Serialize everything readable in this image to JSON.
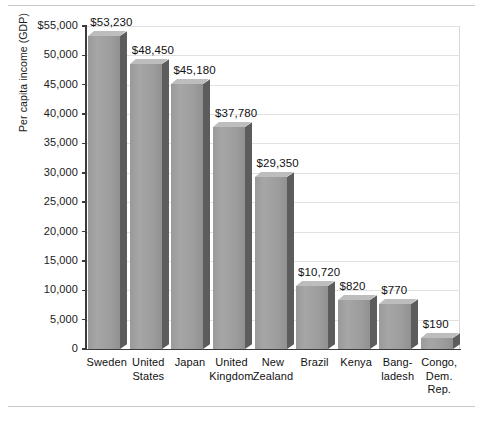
{
  "figure": {
    "has_top_rule": true,
    "has_bottom_rule": true
  },
  "chart_data": {
    "type": "bar",
    "title": "",
    "subtitle": "",
    "xlabel": "",
    "ylabel": "Per capita income (GDP)",
    "categories": [
      "Sweden",
      "United States",
      "Japan",
      "United Kingdom",
      "New Zealand",
      "Brazil",
      "Kenya",
      "Bangladesh",
      "Congo, Dem. Rep."
    ],
    "category_lines": [
      [
        "Sweden"
      ],
      [
        "United",
        "States"
      ],
      [
        "Japan"
      ],
      [
        "United",
        "Kingdom"
      ],
      [
        "New",
        "Zealand"
      ],
      [
        "Brazil"
      ],
      [
        "Kenya"
      ],
      [
        "Bang-",
        "ladesh"
      ],
      [
        "Congo,",
        "Dem.",
        "Rep."
      ]
    ],
    "values": [
      53230,
      48450,
      45180,
      37780,
      29350,
      10720,
      820,
      770,
      190
    ],
    "data_labels": [
      "$53,230",
      "$48,450",
      "$45,180",
      "$37,780",
      "$29,350",
      "$10,720",
      "$820",
      "$770",
      "$190"
    ],
    "drawn_heights": [
      53230,
      48450,
      45180,
      37780,
      29350,
      10720,
      8300,
      7700,
      1900
    ],
    "ylim": [
      0,
      55000
    ],
    "ytick_values": [
      0,
      5000,
      10000,
      15000,
      20000,
      25000,
      30000,
      35000,
      40000,
      45000,
      50000,
      55000
    ],
    "ytick_labels": [
      "0",
      "5,000",
      "10,000",
      "15,000",
      "20,000",
      "25,000",
      "30,000",
      "35,000",
      "40,000",
      "45,000",
      "50,000",
      "$55,000"
    ],
    "grid": true,
    "grid_axis": "y",
    "legend": false,
    "style_3d": true,
    "colors": {
      "bar_front": "#a0a0a0",
      "bar_top": "#bdbdbd",
      "bar_side": "#5c5c5c",
      "gridline": "#e2e2e2",
      "axis": "#3a3a3a",
      "text": "#111111",
      "background": "#ffffff"
    }
  }
}
